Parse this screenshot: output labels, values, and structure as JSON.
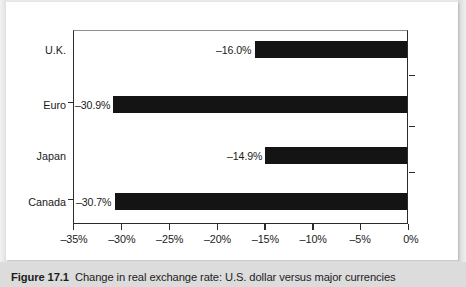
{
  "figure": {
    "caption_label": "Figure 17.1",
    "caption_text": "Change in real exchange rate: U.S. dollar versus major currencies"
  },
  "chart_data": {
    "type": "bar",
    "orientation": "horizontal",
    "title": "",
    "xlabel": "",
    "ylabel": "",
    "categories": [
      "U.K.",
      "Euro",
      "Japan",
      "Canada"
    ],
    "values": [
      -16.0,
      -30.9,
      -14.9,
      -30.7
    ],
    "data_labels": [
      "–16.0%",
      "–30.9%",
      "–14.9%",
      "–30.7%"
    ],
    "xlim": [
      -35,
      0
    ],
    "xticks": [
      -35,
      -30,
      -25,
      -20,
      -15,
      -10,
      -5,
      0
    ],
    "xtick_labels": [
      "–35%",
      "–30%",
      "–25%",
      "–20%",
      "–15%",
      "–10%",
      "–5%",
      "0%"
    ],
    "grid": false,
    "legend": false,
    "bar_color": "#141414",
    "axis_color": "#2b2b2b",
    "plot_background": "#ffffff"
  }
}
